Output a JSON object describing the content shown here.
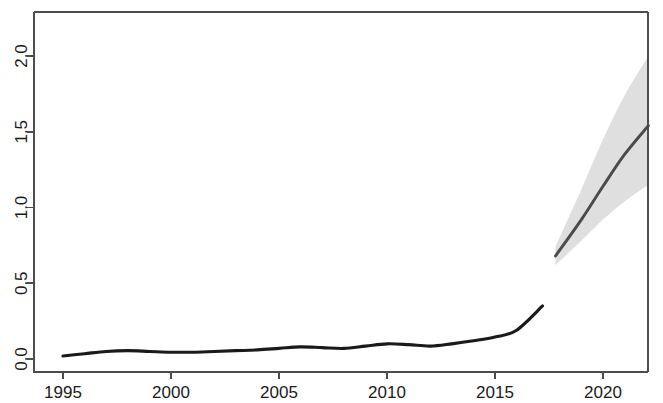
{
  "chart_data": {
    "type": "line",
    "title": "",
    "subtitle": "",
    "xlabel": "",
    "ylabel": "",
    "xlim": [
      1994.4,
      2022.5
    ],
    "ylim": [
      -0.05,
      2.25
    ],
    "grid": false,
    "legend": null,
    "x_ticks": [
      1995,
      2000,
      2005,
      2010,
      2015,
      2020
    ],
    "x_tick_labels": [
      "1995",
      "2000",
      "2005",
      "2010",
      "2015",
      "2020"
    ],
    "y_ticks": [
      0.0,
      0.5,
      1.0,
      1.5,
      2.0
    ],
    "y_tick_labels": [
      "0.0",
      "0.5",
      "1.0",
      "1.5",
      "2.0"
    ],
    "series": [
      {
        "name": "historical",
        "style": "solid-black-line",
        "color": "#1a1a1a",
        "x": [
          1995,
          1996,
          1997,
          1998,
          1999,
          2000,
          2001,
          2002,
          2003,
          2004,
          2005,
          2006,
          2007,
          2008,
          2009,
          2010,
          2011,
          2012,
          2013,
          2014,
          2015,
          2016,
          2017.2
        ],
        "values": [
          0.02,
          0.035,
          0.05,
          0.055,
          0.05,
          0.045,
          0.045,
          0.05,
          0.055,
          0.06,
          0.07,
          0.08,
          0.075,
          0.07,
          0.085,
          0.1,
          0.095,
          0.085,
          0.1,
          0.12,
          0.145,
          0.19,
          0.35
        ]
      },
      {
        "name": "forecast-mean",
        "style": "solid-gray-line",
        "color": "#4a4a4a",
        "x": [
          2017.8,
          2019,
          2020,
          2021,
          2022.1
        ],
        "values": [
          0.68,
          0.92,
          1.14,
          1.35,
          1.54
        ]
      }
    ],
    "bands": [
      {
        "name": "forecast-interval",
        "color": "#d9d9d9",
        "x": [
          2017.8,
          2019,
          2020,
          2021,
          2022.1
        ],
        "lower": [
          0.62,
          0.78,
          0.92,
          1.04,
          1.15
        ],
        "upper": [
          0.74,
          1.12,
          1.45,
          1.74,
          2.0
        ]
      }
    ]
  }
}
